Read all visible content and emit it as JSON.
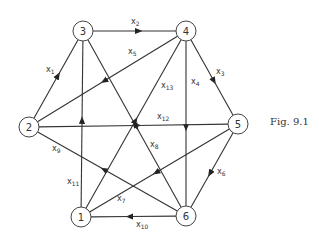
{
  "figure": {
    "caption": "Fig. 9.1",
    "nodes": [
      {
        "id": "1",
        "label": "1",
        "x": 81,
        "y": 217
      },
      {
        "id": "2",
        "label": "2",
        "x": 29,
        "y": 127
      },
      {
        "id": "3",
        "label": "3",
        "x": 83,
        "y": 31
      },
      {
        "id": "4",
        "label": "4",
        "x": 186,
        "y": 31
      },
      {
        "id": "5",
        "label": "5",
        "x": 238,
        "y": 124
      },
      {
        "id": "6",
        "label": "6",
        "x": 186,
        "y": 216
      }
    ],
    "edges": [
      {
        "id": "x1",
        "name": "x",
        "sub": "1",
        "from": "2",
        "to": "3",
        "lx": 46,
        "ly": 72
      },
      {
        "id": "x2",
        "name": "x",
        "sub": "2",
        "from": "3",
        "to": "4",
        "lx": 131,
        "ly": 24
      },
      {
        "id": "x3",
        "name": "x",
        "sub": "3",
        "from": "4",
        "to": "5",
        "lx": 216,
        "ly": 74
      },
      {
        "id": "x4",
        "name": "x",
        "sub": "4",
        "from": "4",
        "to": "6",
        "lx": 191,
        "ly": 84
      },
      {
        "id": "x5",
        "name": "x",
        "sub": "5",
        "from": "4",
        "to": "2",
        "lx": 128,
        "ly": 54
      },
      {
        "id": "x6",
        "name": "x",
        "sub": "6",
        "from": "5",
        "to": "6",
        "lx": 217,
        "ly": 174
      },
      {
        "id": "x7",
        "name": "x",
        "sub": "7",
        "from": "5",
        "to": "1",
        "lx": 117,
        "ly": 201
      },
      {
        "id": "x8",
        "name": "x",
        "sub": "8",
        "from": "3",
        "to": "6",
        "lx": 150,
        "ly": 147
      },
      {
        "id": "x9",
        "name": "x",
        "sub": "9",
        "from": "6",
        "to": "2",
        "lx": 52,
        "ly": 151
      },
      {
        "id": "x10",
        "name": "x",
        "sub": "10",
        "from": "6",
        "to": "1",
        "lx": 136,
        "ly": 227
      },
      {
        "id": "x11",
        "name": "x",
        "sub": "11",
        "from": "1",
        "to": "3",
        "lx": 67,
        "ly": 184
      },
      {
        "id": "x12",
        "name": "x",
        "sub": "12",
        "from": "2",
        "to": "5",
        "lx": 157,
        "ly": 119
      },
      {
        "id": "x13",
        "name": "x",
        "sub": "13",
        "from": "1",
        "to": "4",
        "lx": 161,
        "ly": 88
      }
    ],
    "colors": {
      "line": "#333333",
      "background": "#ffffff"
    }
  }
}
